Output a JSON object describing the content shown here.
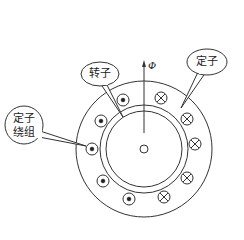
{
  "diagram": {
    "type": "motor-cross-section",
    "labels": {
      "rotor": "转子",
      "stator": "定子",
      "stator_winding_line1": "定子",
      "stator_winding_line2": "绕组",
      "flux": "Φ"
    },
    "geometry": {
      "center": [
        144,
        149
      ],
      "outer_radius": 68,
      "stator_bore_radius": 44,
      "rotor_radius": 38,
      "shaft_radius": 4
    },
    "conductors_dot": [
      [
        123,
        100
      ],
      [
        101,
        121
      ],
      [
        92,
        149
      ],
      [
        103,
        181
      ],
      [
        129,
        199
      ]
    ],
    "conductors_cross": [
      [
        161,
        98
      ],
      [
        187,
        119
      ],
      [
        195,
        144
      ],
      [
        187,
        178
      ],
      [
        164,
        197
      ]
    ],
    "colors": {
      "line": "#333333",
      "background": "#ffffff"
    }
  }
}
